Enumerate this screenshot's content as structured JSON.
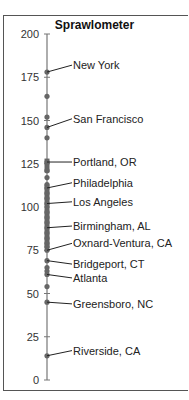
{
  "chart_data": {
    "type": "scatter",
    "title": "Sprawlometer",
    "xlabel": "",
    "ylabel": "",
    "ylim": [
      0,
      200
    ],
    "yticks": [
      0,
      25,
      50,
      75,
      100,
      125,
      150,
      175,
      200
    ],
    "grid": false,
    "legend": null,
    "labeled_points": [
      {
        "label": "New York",
        "value": 178
      },
      {
        "label": "San Francisco",
        "value": 146
      },
      {
        "label": "Portland, OR",
        "value": 126
      },
      {
        "label": "Philadelphia",
        "value": 111
      },
      {
        "label": "Los Angeles",
        "value": 102
      },
      {
        "label": "Birmingham, AL",
        "value": 88
      },
      {
        "label": "Oxnard-Ventura, CA",
        "value": 75
      },
      {
        "label": "Bridgeport, CT",
        "value": 69
      },
      {
        "label": "Atlanta",
        "value": 61
      },
      {
        "label": "Greensboro, NC",
        "value": 45
      },
      {
        "label": "Riverside, CA",
        "value": 14
      }
    ],
    "unlabeled_points": [
      164,
      152,
      140,
      121,
      117,
      113,
      108,
      105,
      97,
      94,
      91,
      85,
      82,
      79,
      77,
      65,
      63,
      54
    ]
  }
}
